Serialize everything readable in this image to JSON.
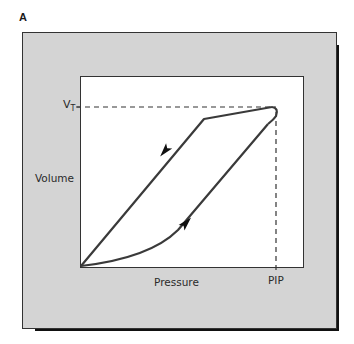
{
  "figure": {
    "panel_label": "A",
    "y_axis_label": "Volume",
    "x_axis_label": "Pressure",
    "y_marker": {
      "main": "V",
      "sub": "T"
    },
    "x_marker": "PIP"
  },
  "colors": {
    "frame_fill": "#d4d4d4",
    "frame_shadow": "#111111",
    "plot_bg": "#ffffff",
    "curve": "#3a3a3a",
    "text": "#2a2a2a"
  },
  "diagram": {
    "type": "pressure-volume loop",
    "loop": {
      "inspiratory_limb": "lower curve from origin to (PIP, VT), arrow pointing up-right",
      "expiratory_limb": "upper curve from (PIP, VT) back to origin, arrow pointing down-left"
    },
    "reference_lines": [
      {
        "type": "dashed-horizontal",
        "at": "VT"
      },
      {
        "type": "dashed-vertical",
        "at": "PIP"
      }
    ]
  }
}
